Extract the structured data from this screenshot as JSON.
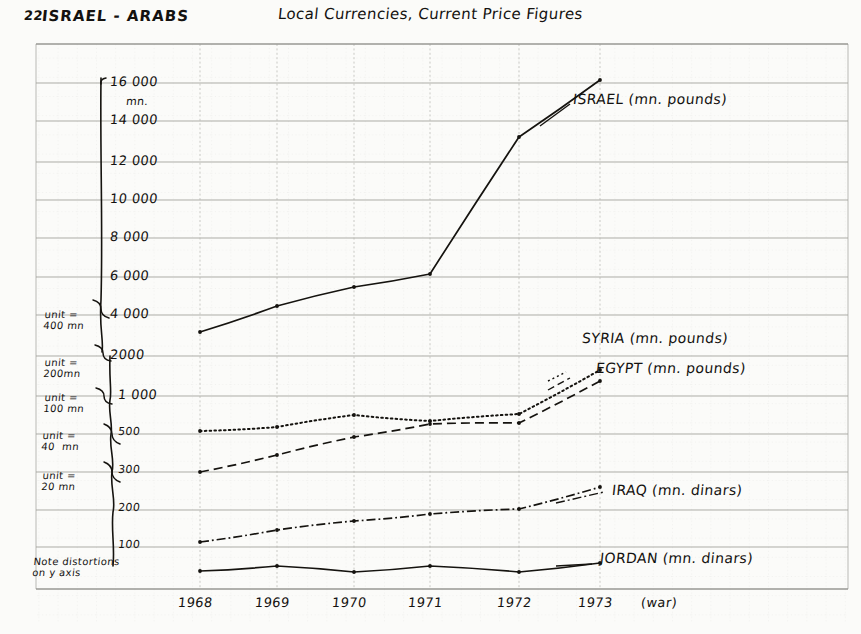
{
  "page": {
    "number": "22",
    "corner_title": "ISRAEL - ARABS",
    "main_title": "Local Currencies, Current Price Figures"
  },
  "axis_note": "Note distortions\non y axis",
  "units": [
    {
      "label": "unit =\n400 mn",
      "x": 44,
      "y": 309
    },
    {
      "label": "unit =\n200mn",
      "x": 44,
      "y": 357
    },
    {
      "label": "unit =\n100 mn",
      "x": 44,
      "y": 392
    },
    {
      "label": "unit =\n40  mn",
      "x": 42,
      "y": 430
    },
    {
      "label": "unit =\n20 mn",
      "x": 42,
      "y": 470
    }
  ],
  "y_axis": {
    "unit_suffix": "mn.",
    "ticks": [
      {
        "label": "16 000",
        "value": 16000,
        "y": 83
      },
      {
        "label": "14 000",
        "value": 14000,
        "y": 121
      },
      {
        "label": "12 000",
        "value": 12000,
        "y": 162
      },
      {
        "label": "10 000",
        "value": 10000,
        "y": 200
      },
      {
        "label": "8 000",
        "value": 8000,
        "y": 238
      },
      {
        "label": "6 000",
        "value": 6000,
        "y": 277
      },
      {
        "label": "4 000",
        "value": 4000,
        "y": 315
      },
      {
        "label": "2000",
        "value": 2000,
        "y": 356
      },
      {
        "label": "1 000",
        "value": 1000,
        "y": 396
      },
      {
        "label": "500",
        "value": 500,
        "y": 434
      },
      {
        "label": "300",
        "value": 300,
        "y": 472
      },
      {
        "label": "200",
        "value": 200,
        "y": 510
      },
      {
        "label": "100",
        "value": 100,
        "y": 547
      }
    ]
  },
  "x_axis": {
    "ticks": [
      {
        "label": "1968",
        "x": 200
      },
      {
        "label": "1969",
        "x": 277
      },
      {
        "label": "1970",
        "x": 354
      },
      {
        "label": "1971",
        "x": 430
      },
      {
        "label": "1972",
        "x": 519
      },
      {
        "label": "1973",
        "x": 600
      }
    ],
    "war_annotation": "(war)"
  },
  "series_labels": [
    {
      "name": "israel",
      "text": "ISRAEL  (mn. pounds)",
      "x": 573,
      "y": 101
    },
    {
      "name": "syria",
      "text": "SYRIA (mn. pounds)",
      "x": 582,
      "y": 340
    },
    {
      "name": "egypt",
      "text": "EGYPT (mn. pounds)",
      "x": 596,
      "y": 370
    },
    {
      "name": "iraq",
      "text": "IRAQ (mn. dinars)",
      "x": 612,
      "y": 492
    },
    {
      "name": "jordan",
      "text": "JORDAN (mn. dinars)",
      "x": 600,
      "y": 560
    }
  ],
  "chart_data": {
    "type": "line",
    "title": "Local Currencies, Current Price Figures",
    "subtitle": "ISRAEL - ARABS",
    "xlabel": "",
    "ylabel": "mn.",
    "x": [
      "1968",
      "1969",
      "1970",
      "1971",
      "1972",
      "1973"
    ],
    "grid": true,
    "legend": "inline-right-labels",
    "y_scale": "distorted / piecewise (see unit annotations)",
    "ylim": [
      0,
      16000
    ],
    "annotations": [
      "Note distortions on y axis",
      "1973 (war)"
    ],
    "series": [
      {
        "name": "ISRAEL (mn. pounds)",
        "style": "solid",
        "values": [
          3000,
          4300,
          5300,
          6100,
          13200,
          16100
        ],
        "points_px": [
          [
            200,
            332
          ],
          [
            277,
            306
          ],
          [
            354,
            287
          ],
          [
            430,
            274
          ],
          [
            519,
            137
          ],
          [
            600,
            80
          ]
        ]
      },
      {
        "name": "SYRIA (mn. pounds)",
        "style": "dashed",
        "values": [
          300,
          360,
          490,
          620,
          640,
          1150
        ],
        "points_px": [
          [
            200,
            472
          ],
          [
            277,
            455
          ],
          [
            354,
            437
          ],
          [
            430,
            424
          ],
          [
            519,
            423
          ],
          [
            600,
            381
          ]
        ]
      },
      {
        "name": "EGYPT (mn. pounds)",
        "style": "dotted",
        "values": [
          530,
          560,
          640,
          620,
          670,
          1300
        ],
        "points_px": [
          [
            200,
            431
          ],
          [
            277,
            427
          ],
          [
            354,
            415
          ],
          [
            430,
            421
          ],
          [
            519,
            414
          ],
          [
            600,
            370
          ]
        ]
      },
      {
        "name": "IRAQ (mn. dinars)",
        "style": "dash-dot",
        "values": [
          105,
          123,
          140,
          155,
          168,
          215
        ],
        "points_px": [
          [
            200,
            542
          ],
          [
            277,
            530
          ],
          [
            354,
            521
          ],
          [
            430,
            514
          ],
          [
            519,
            509
          ],
          [
            600,
            487
          ]
        ]
      },
      {
        "name": "JORDAN (mn. dinars)",
        "style": "solid-flat",
        "values": [
          22,
          30,
          24,
          30,
          24,
          34
        ],
        "points_px": [
          [
            200,
            571
          ],
          [
            277,
            566
          ],
          [
            354,
            572
          ],
          [
            430,
            566
          ],
          [
            519,
            572
          ],
          [
            600,
            563
          ]
        ]
      }
    ]
  },
  "colors": {
    "ink": "#15130f",
    "paper": "#fbfbf9",
    "grid_major": "#9a9a96",
    "grid_minor": "#c9c9c4"
  }
}
